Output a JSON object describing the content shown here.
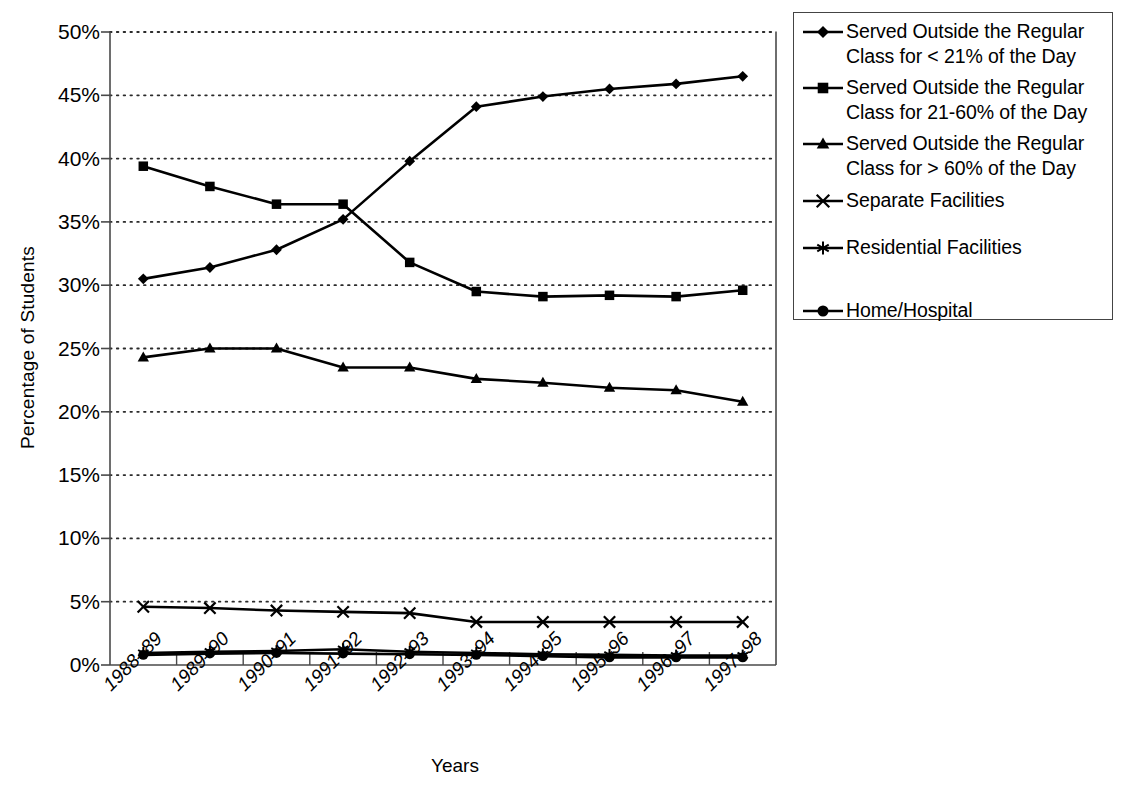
{
  "chart_data": {
    "type": "line",
    "title": "",
    "xlabel": "Years",
    "ylabel": "Percentage of Students",
    "categories": [
      "1988–89",
      "1989–90",
      "1990–91",
      "1991–92",
      "1992–93",
      "1993–94",
      "1994–95",
      "1995–96",
      "1996–97",
      "1997–98"
    ],
    "ylim": [
      0,
      50
    ],
    "ytick_labels": [
      "0%",
      "5%",
      "10%",
      "15%",
      "20%",
      "25%",
      "30%",
      "35%",
      "40%",
      "45%",
      "50%"
    ],
    "ytick_values": [
      0,
      5,
      10,
      15,
      20,
      25,
      30,
      35,
      40,
      45,
      50
    ],
    "grid": "horizontal-dotted",
    "legend_position": "top-right-outside",
    "series": [
      {
        "name": "Served Outside the Regular\nClass for < 21% of the Day",
        "marker": "diamond",
        "values": [
          30.5,
          31.4,
          32.8,
          35.2,
          39.8,
          44.1,
          44.9,
          45.5,
          45.9,
          46.5
        ]
      },
      {
        "name": "Served Outside the Regular\nClass for 21-60% of the Day",
        "marker": "square",
        "values": [
          39.4,
          37.8,
          36.4,
          36.4,
          31.8,
          29.5,
          29.1,
          29.2,
          29.1,
          29.6
        ]
      },
      {
        "name": "Served Outside the Regular\nClass for > 60% of the Day",
        "marker": "triangle",
        "values": [
          24.3,
          25.0,
          25.0,
          23.5,
          23.5,
          22.6,
          22.3,
          21.9,
          21.7,
          20.8
        ]
      },
      {
        "name": "Separate Facilities",
        "marker": "cross",
        "values": [
          4.6,
          4.5,
          4.3,
          4.2,
          4.1,
          3.4,
          3.4,
          3.4,
          3.4,
          3.4
        ]
      },
      {
        "name": "Residential Facilities",
        "marker": "asterisk",
        "values": [
          0.95,
          1.05,
          1.1,
          1.25,
          1.05,
          0.95,
          0.85,
          0.8,
          0.75,
          0.75
        ]
      },
      {
        "name": "Home/Hospital",
        "marker": "circle",
        "values": [
          0.8,
          0.9,
          0.95,
          0.9,
          0.85,
          0.8,
          0.7,
          0.6,
          0.6,
          0.6
        ]
      }
    ]
  },
  "axes": {
    "y_title": "Percentage of Students",
    "x_title": "Years"
  },
  "legend": {
    "items": [
      {
        "marker": "diamond",
        "label": "Served Outside the Regular\nClass for < 21% of the Day"
      },
      {
        "marker": "square",
        "label": "Served Outside the Regular\nClass for 21-60% of the Day"
      },
      {
        "marker": "triangle",
        "label": "Served Outside the Regular\nClass for > 60% of the Day"
      },
      {
        "marker": "cross",
        "label": "Separate Facilities"
      },
      {
        "marker": "asterisk",
        "label": "Residential Facilities"
      },
      {
        "marker": "circle",
        "label": "Home/Hospital"
      }
    ]
  },
  "colors": {
    "line": "#000000",
    "grid": "#2b2b2b",
    "axis": "#4a4a4a",
    "background": "#ffffff"
  }
}
